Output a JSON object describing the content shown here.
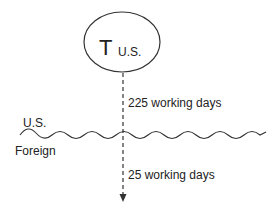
{
  "node": {
    "label_main": "T",
    "label_sub": "U.S.",
    "shape": "ellipse"
  },
  "flow": {
    "upper_label": "225 working days",
    "lower_label": "25 working days",
    "line_style": "dashed",
    "direction": "down"
  },
  "border": {
    "shape": "wavy-line",
    "above_label": "U.S.",
    "below_label": "Foreign"
  },
  "colors": {
    "stroke": "#333333",
    "text": "#222222",
    "background": "#ffffff"
  }
}
